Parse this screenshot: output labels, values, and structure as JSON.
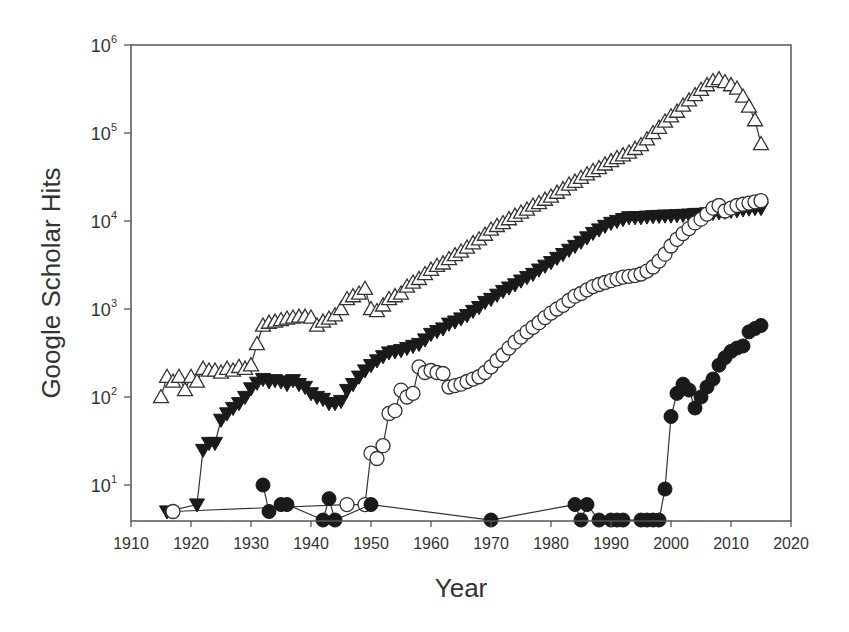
{
  "chart_data": {
    "type": "scatter",
    "title": "",
    "xlabel": "Year",
    "ylabel": "Google Scholar Hits",
    "xlim": [
      1910,
      2020
    ],
    "ylim": [
      3.9,
      1000000
    ],
    "yscale": "log",
    "grid": false,
    "legend": null,
    "x_ticks": [
      1910,
      1920,
      1930,
      1940,
      1950,
      1960,
      1970,
      1980,
      1990,
      2000,
      2010,
      2020
    ],
    "y_ticks": [
      {
        "value": 10,
        "base": "10",
        "exp": "1"
      },
      {
        "value": 100,
        "base": "10",
        "exp": "2"
      },
      {
        "value": 1000,
        "base": "10",
        "exp": "3"
      },
      {
        "value": 10000,
        "base": "10",
        "exp": "4"
      },
      {
        "value": 100000,
        "base": "10",
        "exp": "5"
      },
      {
        "value": 1000000,
        "base": "10",
        "exp": "6"
      }
    ],
    "series": [
      {
        "name": "Series A (open up-triangle)",
        "marker": "triangle-up-open",
        "x": [
          1915,
          1916,
          1917,
          1918,
          1919,
          1920,
          1921,
          1922,
          1923,
          1924,
          1925,
          1926,
          1927,
          1928,
          1929,
          1930,
          1931,
          1932,
          1933,
          1934,
          1935,
          1936,
          1937,
          1938,
          1939,
          1940,
          1941,
          1942,
          1943,
          1944,
          1945,
          1946,
          1947,
          1948,
          1949,
          1950,
          1951,
          1952,
          1953,
          1954,
          1955,
          1956,
          1957,
          1958,
          1959,
          1960,
          1961,
          1962,
          1963,
          1964,
          1965,
          1966,
          1967,
          1968,
          1969,
          1970,
          1971,
          1972,
          1973,
          1974,
          1975,
          1976,
          1977,
          1978,
          1979,
          1980,
          1981,
          1982,
          1983,
          1984,
          1985,
          1986,
          1987,
          1988,
          1989,
          1990,
          1991,
          1992,
          1993,
          1994,
          1995,
          1996,
          1997,
          1998,
          1999,
          2000,
          2001,
          2002,
          2003,
          2004,
          2005,
          2006,
          2007,
          2008,
          2009,
          2010,
          2011,
          2012,
          2013,
          2014,
          2015
        ],
        "y": [
          100,
          170,
          150,
          170,
          120,
          170,
          150,
          210,
          200,
          200,
          190,
          210,
          200,
          220,
          210,
          230,
          400,
          650,
          700,
          720,
          750,
          780,
          800,
          820,
          820,
          800,
          650,
          720,
          780,
          850,
          1000,
          1300,
          1400,
          1500,
          1700,
          1000,
          950,
          1100,
          1300,
          1400,
          1500,
          1800,
          2000,
          2200,
          2500,
          2800,
          3100,
          3300,
          3700,
          4100,
          4500,
          5000,
          5600,
          6200,
          7000,
          8000,
          8800,
          9500,
          10500,
          11500,
          12500,
          13500,
          15000,
          16000,
          17500,
          19000,
          21000,
          23000,
          26000,
          28000,
          31000,
          34000,
          37000,
          40000,
          44000,
          48000,
          52000,
          56000,
          60000,
          66000,
          73000,
          85000,
          100000,
          115000,
          135000,
          155000,
          175000,
          205000,
          235000,
          270000,
          310000,
          350000,
          390000,
          410000,
          380000,
          350000,
          320000,
          260000,
          200000,
          140000,
          75000
        ]
      },
      {
        "name": "Series B (filled down-triangle)",
        "marker": "triangle-down-filled",
        "x": [
          1916,
          1921,
          1922,
          1923,
          1924,
          1925,
          1926,
          1927,
          1928,
          1929,
          1930,
          1931,
          1932,
          1933,
          1934,
          1935,
          1936,
          1937,
          1938,
          1939,
          1940,
          1941,
          1942,
          1943,
          1944,
          1945,
          1946,
          1947,
          1948,
          1949,
          1950,
          1951,
          1952,
          1953,
          1954,
          1955,
          1956,
          1957,
          1958,
          1959,
          1960,
          1961,
          1962,
          1963,
          1964,
          1965,
          1966,
          1967,
          1968,
          1969,
          1970,
          1971,
          1972,
          1973,
          1974,
          1975,
          1976,
          1977,
          1978,
          1979,
          1980,
          1981,
          1982,
          1983,
          1984,
          1985,
          1986,
          1987,
          1988,
          1989,
          1990,
          1991,
          1992,
          1993,
          1994,
          1995,
          1996,
          1997,
          1998,
          1999,
          2000,
          2001,
          2002,
          2003,
          2004,
          2005,
          2006,
          2007,
          2008,
          2009,
          2010,
          2011,
          2012,
          2013,
          2014,
          2015
        ],
        "y": [
          5,
          6,
          25,
          30,
          30,
          55,
          65,
          75,
          85,
          100,
          125,
          145,
          160,
          150,
          155,
          150,
          140,
          155,
          140,
          130,
          110,
          100,
          95,
          85,
          85,
          90,
          120,
          140,
          170,
          200,
          230,
          260,
          290,
          320,
          330,
          340,
          360,
          380,
          400,
          450,
          520,
          560,
          600,
          680,
          720,
          780,
          850,
          950,
          1050,
          1200,
          1300,
          1450,
          1600,
          1750,
          1900,
          2100,
          2300,
          2500,
          2800,
          3100,
          3400,
          3800,
          4200,
          4700,
          5200,
          5800,
          6500,
          7300,
          8000,
          8800,
          9500,
          10000,
          10500,
          11000,
          11000,
          11000,
          11200,
          11300,
          11400,
          11500,
          11500,
          11600,
          11700,
          11800,
          12000,
          12000,
          12200,
          12300,
          12500,
          12700,
          13000,
          13200,
          13500,
          13800,
          14000,
          14000
        ]
      },
      {
        "name": "Series C (open circle)",
        "marker": "circle-open",
        "x": [
          1917,
          1946,
          1949,
          1950,
          1951,
          1952,
          1953,
          1954,
          1955,
          1956,
          1957,
          1958,
          1959,
          1960,
          1961,
          1962,
          1963,
          1964,
          1965,
          1966,
          1967,
          1968,
          1969,
          1970,
          1971,
          1972,
          1973,
          1974,
          1975,
          1976,
          1977,
          1978,
          1979,
          1980,
          1981,
          1982,
          1983,
          1984,
          1985,
          1986,
          1987,
          1988,
          1989,
          1990,
          1991,
          1992,
          1993,
          1994,
          1995,
          1996,
          1997,
          1998,
          1999,
          2000,
          2001,
          2002,
          2003,
          2004,
          2005,
          2006,
          2007,
          2008,
          2009,
          2010,
          2011,
          2012,
          2013,
          2014,
          2015
        ],
        "y": [
          5,
          6,
          6,
          23,
          20,
          28,
          65,
          70,
          120,
          100,
          110,
          220,
          190,
          200,
          190,
          185,
          130,
          135,
          140,
          150,
          160,
          170,
          190,
          220,
          260,
          300,
          360,
          420,
          480,
          550,
          620,
          700,
          800,
          900,
          1000,
          1100,
          1250,
          1400,
          1500,
          1650,
          1800,
          1900,
          2000,
          2100,
          2200,
          2300,
          2350,
          2400,
          2500,
          2700,
          3000,
          3500,
          4200,
          5200,
          6200,
          7200,
          8200,
          9500,
          10500,
          12000,
          14000,
          15000,
          13000,
          14000,
          15000,
          15500,
          16000,
          16500,
          17000
        ]
      },
      {
        "name": "Series D (filled circle)",
        "marker": "circle-filled",
        "x": [
          1932,
          1933,
          1935,
          1936,
          1942,
          1943,
          1944,
          1950,
          1970,
          1984,
          1985,
          1986,
          1988,
          1990,
          1991,
          1992,
          1995,
          1996,
          1997,
          1998,
          1999,
          2000,
          2001,
          2002,
          2003,
          2004,
          2005,
          2006,
          2007,
          2008,
          2009,
          2010,
          2011,
          2012,
          2013,
          2014,
          2015
        ],
        "y": [
          10,
          5,
          6,
          6,
          4,
          7,
          4,
          6,
          4,
          6,
          4,
          6,
          4,
          4,
          4,
          4,
          4,
          4,
          4,
          4,
          9,
          60,
          110,
          140,
          120,
          75,
          100,
          130,
          160,
          230,
          280,
          330,
          360,
          380,
          550,
          600,
          650
        ]
      }
    ]
  }
}
